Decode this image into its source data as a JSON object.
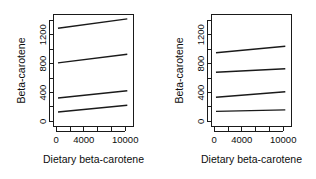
{
  "chart_data": [
    {
      "type": "line",
      "panel": "left",
      "title": "",
      "xlabel": "Dietary beta-carotene",
      "ylabel": "Beta-carotene",
      "xlim": [
        -400,
        11200
      ],
      "ylim": [
        -70,
        1480
      ],
      "xticks": [
        0,
        4000,
        10000
      ],
      "xtick_labels": [
        "0",
        "4000",
        "10000"
      ],
      "xticks_minor": [
        0,
        2000,
        4000,
        6000,
        8000,
        10000
      ],
      "yticks": [
        0,
        400,
        800,
        1200
      ],
      "ytick_labels": [
        "0",
        "400",
        "800",
        "1200"
      ],
      "yticks_minor": [
        0,
        200,
        400,
        600,
        800,
        1000,
        1200,
        1400
      ],
      "grid": false,
      "legend": "none",
      "x": [
        250,
        10300
      ],
      "series": [
        {
          "name": "line-1",
          "values": [
            1290,
            1420
          ]
        },
        {
          "name": "line-2",
          "values": [
            810,
            930
          ]
        },
        {
          "name": "line-3",
          "values": [
            325,
            425
          ]
        },
        {
          "name": "line-4",
          "values": [
            130,
            225
          ]
        }
      ]
    },
    {
      "type": "line",
      "panel": "right",
      "title": "",
      "xlabel": "Dietary beta-carotene",
      "ylabel": "Beta-carotene",
      "xlim": [
        -400,
        11200
      ],
      "ylim": [
        -70,
        1480
      ],
      "xticks": [
        0,
        4000,
        10000
      ],
      "xtick_labels": [
        "0",
        "4000",
        "10000"
      ],
      "xticks_minor": [
        0,
        2000,
        4000,
        6000,
        8000,
        10000
      ],
      "yticks": [
        0,
        400,
        800,
        1200
      ],
      "ytick_labels": [
        "0",
        "400",
        "800",
        "1200"
      ],
      "yticks_minor": [
        0,
        200,
        400,
        600,
        800,
        1000,
        1200,
        1400
      ],
      "grid": false,
      "legend": "none",
      "x": [
        250,
        10300
      ],
      "series": [
        {
          "name": "line-1",
          "values": [
            950,
            1040
          ]
        },
        {
          "name": "line-2",
          "values": [
            680,
            730
          ]
        },
        {
          "name": "line-3",
          "values": [
            335,
            410
          ]
        },
        {
          "name": "line-4",
          "values": [
            140,
            160
          ]
        }
      ]
    }
  ],
  "panels": {
    "left": {
      "xlabel": "Dietary beta-carotene",
      "ylabel": "Beta-carotene",
      "xtick_labels": [
        "0",
        "4000",
        "10000"
      ],
      "ytick_labels": [
        "0",
        "400",
        "800",
        "1200"
      ]
    },
    "right": {
      "xlabel": "Dietary beta-carotene",
      "ylabel": "Beta-carotene",
      "xtick_labels": [
        "0",
        "4000",
        "10000"
      ],
      "ytick_labels": [
        "0",
        "400",
        "800",
        "1200"
      ]
    }
  }
}
